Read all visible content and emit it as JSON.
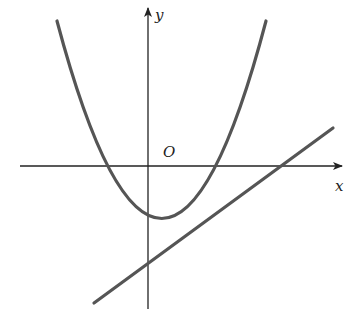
{
  "diagram": {
    "type": "coordinate-plot",
    "labels": {
      "y_axis": "y",
      "x_axis": "x",
      "origin": "O"
    },
    "curves": [
      {
        "name": "parabola",
        "description": "upward-opening parabola, vertex below x-axis slightly right of y-axis, crossing x-axis at two points"
      },
      {
        "name": "line",
        "description": "line with positive slope, negative y-intercept, crossing x-axis right of parabola"
      }
    ],
    "colors": {
      "axis": "#222222",
      "curve": "#555555",
      "background": "#ffffff"
    }
  }
}
